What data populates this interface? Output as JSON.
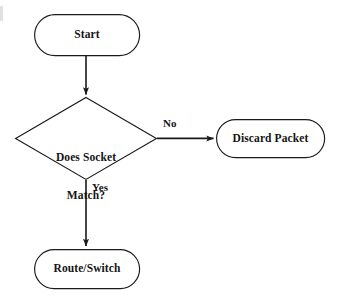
{
  "diagram": {
    "type": "flowchart",
    "canvas": {
      "width": 338,
      "height": 304,
      "background": "#ffffff"
    },
    "stroke_color": "#1a1a1a",
    "text_color": "#151515",
    "nodes": [
      {
        "id": "start",
        "shape": "rounded-rectangle",
        "label": "Start",
        "x": 34,
        "y": 14,
        "width": 106,
        "height": 42
      },
      {
        "id": "decision",
        "shape": "diamond",
        "label": "Does Socket\nMatch?",
        "line1": "Does Socket",
        "line2": "Match?",
        "x": 14,
        "y": 97,
        "width": 143,
        "height": 83
      },
      {
        "id": "discard",
        "shape": "rounded-rectangle",
        "label": "Discard Packet",
        "x": 216,
        "y": 119,
        "width": 109,
        "height": 39
      },
      {
        "id": "route",
        "shape": "rounded-rectangle",
        "label": "Route/Switch",
        "x": 34,
        "y": 249,
        "width": 106,
        "height": 40
      }
    ],
    "edges": [
      {
        "id": "start-to-decision",
        "from": "start",
        "to": "decision",
        "label": "",
        "direction": "down",
        "x1": 86,
        "y1": 56,
        "x2": 86,
        "y2": 96
      },
      {
        "id": "decision-to-discard",
        "from": "decision",
        "to": "discard",
        "label": "No",
        "direction": "right",
        "x1": 157,
        "y1": 138,
        "x2": 215,
        "y2": 138
      },
      {
        "id": "decision-to-route",
        "from": "decision",
        "to": "route",
        "label": "Yes",
        "direction": "down",
        "x1": 86,
        "y1": 180,
        "x2": 86,
        "y2": 248
      }
    ]
  }
}
